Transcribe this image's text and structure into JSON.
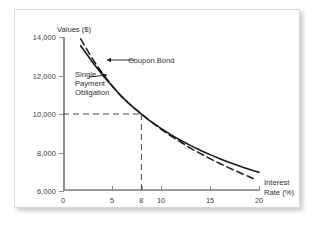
{
  "chart_data": {
    "type": "line",
    "title": "",
    "xlabel": "Interest Rate (%)",
    "ylabel": "Values ($)",
    "xlim": [
      0,
      20
    ],
    "ylim": [
      6000,
      14000
    ],
    "grid": false,
    "legend_position": "inline-annotations",
    "xticks": [
      0,
      5,
      8,
      10,
      15,
      20
    ],
    "xtick_labels": [
      "0",
      "5",
      "8",
      "10",
      "15",
      "20"
    ],
    "yticks": [
      6000,
      8000,
      10000,
      12000,
      14000
    ],
    "ytick_labels": [
      "6,000",
      "8,000",
      "10,000",
      "12,000",
      "14,000"
    ],
    "series": [
      {
        "name": "Coupon Bond",
        "style": "solid",
        "color": "#1a1a1a",
        "x": [
          1.8,
          3,
          4,
          5,
          6,
          7,
          8,
          9,
          10,
          11,
          12,
          13,
          14,
          15,
          16,
          17,
          18,
          19,
          20
        ],
        "values": [
          13550,
          12700,
          12050,
          11450,
          10900,
          10420,
          10000,
          9600,
          9250,
          8930,
          8640,
          8370,
          8120,
          7890,
          7680,
          7480,
          7300,
          7130,
          6970
        ]
      },
      {
        "name": "Single Payment Obligation",
        "style": "dashed",
        "color": "#1a1a1a",
        "x": [
          1.8,
          3,
          4,
          5,
          6,
          7,
          8,
          9,
          10,
          11,
          12,
          13,
          14,
          15,
          16,
          17,
          18,
          19,
          19.4
        ],
        "values": [
          13900,
          12880,
          12130,
          11480,
          10900,
          10420,
          10000,
          9590,
          9210,
          8860,
          8540,
          8230,
          7950,
          7680,
          7430,
          7190,
          6960,
          6740,
          6650
        ]
      }
    ],
    "annotations": [
      {
        "name": "coupon-bond",
        "text": "Coupon Bond",
        "target_x": 3.6,
        "target_y": 12900
      },
      {
        "name": "single-payment-obligation",
        "text": "Single\nPayment\nObligation",
        "line1": "Single",
        "line2": "Payment",
        "line3": "Obligation",
        "target_x": 3.4,
        "target_y": 12050
      }
    ],
    "guide_lines": [
      {
        "name": "par-value-guide",
        "style": "dashed",
        "from_axis": "y",
        "x": 8,
        "y": 10000,
        "label": "10,000 at 8%"
      }
    ]
  },
  "axis_titles": {
    "y": "Values ($)",
    "x_line1": "Interest",
    "x_line2": "Rate (%)"
  },
  "colors": {
    "curve": "#1a1a1a",
    "axis": "#8d8d8d",
    "guide": "#4a4a4a",
    "text": "#2f2f2f",
    "card_border": "#d9d9d9",
    "background": "#ffffff"
  }
}
